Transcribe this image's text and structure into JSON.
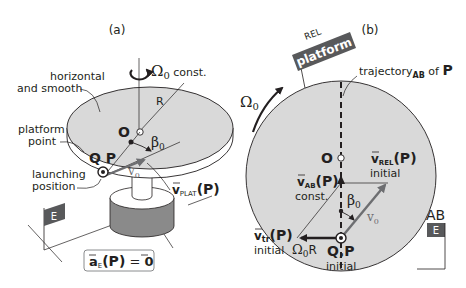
{
  "panel_a": {
    "label": "(a)",
    "omega_symbol": "Ω",
    "omega_sub": "0",
    "omega_suffix": " const.",
    "surface_label_line1": "horizontal",
    "surface_label_line2": "and smooth",
    "radius_label": "R",
    "center_label": "O",
    "beta_symbol": "β",
    "beta_sub": "0",
    "platform_point_line1": "platform",
    "platform_point_line2": "point",
    "qp_label": "Q P",
    "launch_line1": "launching",
    "launch_line2": "position",
    "v0_label": "v",
    "v0_sub": "0",
    "vplat_main": "v",
    "vplat_sub": "PLAT",
    "vplat_arg": "(P)",
    "frame_flag": "E",
    "accel_main": "a",
    "accel_sub": "E",
    "accel_arg": "(P)",
    "accel_eq": " = ",
    "accel_rhs": "0"
  },
  "panel_b": {
    "label": "(b)",
    "rel_label": "REL",
    "flag_label": "platform",
    "trajectory_prefix": "trajectory",
    "trajectory_sub": "AB",
    "trajectory_suffix": " of ",
    "trajectory_point": "P",
    "omega_symbol": "Ω",
    "omega_sub": "0",
    "center_label": "O",
    "vrel_main": "v",
    "vrel_sub": "REL",
    "vrel_arg": "(P)",
    "vrel_note": "initial",
    "vab_main": "v",
    "vab_sub": "AB",
    "vab_arg": "(P)",
    "vab_note": "const.",
    "beta_symbol": "β",
    "beta_sub": "0",
    "v0_label": "v",
    "v0_sub": "0",
    "vtr_main": "v",
    "vtr_sub": "tr",
    "vtr_arg": "(P)",
    "vtr_note": "initial",
    "omegaR_symbol": "Ω",
    "omegaR_sub": "0",
    "omegaR_suffix": "R",
    "qp_label": "Q,P",
    "qp_note": "initial",
    "ab_label": "AB",
    "ab_flag": "E"
  },
  "colors": {
    "disc_fill": "#d9d9d9",
    "flag_fill": "#58595b",
    "pedestal_dark": "#8a8a8a",
    "arrow_gray": "#6d6e71",
    "ink": "#231f20"
  }
}
